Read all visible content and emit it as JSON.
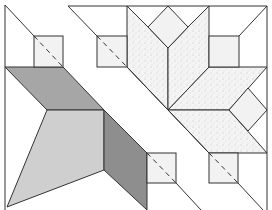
{
  "diagram": {
    "title": "",
    "colors": {
      "background": "#ffffff",
      "stroke": "#333333",
      "dark_gray": "#a6a6a6",
      "medium_gray": "#8e8e8e",
      "light_gray": "#cfcfcf",
      "square_fill": "#f2f2f2",
      "speckle_fill": "#ececec"
    },
    "shapes": {
      "dark_parallelogram": "5,67 63,67 104,110 47,110",
      "light_quad": "47,110 104,110 104,170 7,207",
      "dark_strip": "104,110 147,153 147,210 104,170",
      "small_squares": [
        {
          "x": 34,
          "y": 36,
          "w": 29,
          "h": 31
        },
        {
          "x": 97,
          "y": 36,
          "w": 30,
          "h": 31
        },
        {
          "x": 147,
          "y": 153,
          "w": 29,
          "h": 30
        },
        {
          "x": 209,
          "y": 153,
          "w": 29,
          "h": 30
        },
        {
          "x": 209,
          "y": 36,
          "w": 30,
          "h": 31
        }
      ],
      "tulip_petals": [
        "127,6 148,27 168,48 168,110 127,67",
        "209,6 188,27 168,48 168,110 209,67"
      ],
      "tulip_diamond": "168,6 188,27 168,48 148,27",
      "lower_speckle_parallelogram": "168,110 229,110 267,153 209,153",
      "upper_speckle_parallelogram": "168,110 209,67 267,67 229,110",
      "right_diamond": "229,110 248,88 267,110 248,131"
    }
  }
}
